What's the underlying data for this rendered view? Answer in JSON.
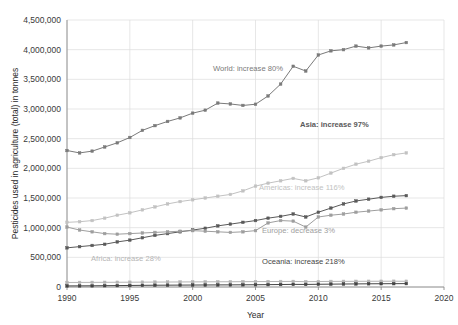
{
  "chart_data": {
    "type": "line",
    "title": "",
    "xlabel": "Year",
    "ylabel": "Pesticides used in agriculture (total) in tonnes",
    "xlim": [
      1990,
      2020
    ],
    "ylim": [
      0,
      4500000
    ],
    "xticks": [
      "1990",
      "1995",
      "2000",
      "2005",
      "2010",
      "2015",
      "2020"
    ],
    "xtick_values": [
      1990,
      1995,
      2000,
      2005,
      2010,
      2015,
      2020
    ],
    "yticks": [
      "0",
      "500,000",
      "1,000,000",
      "1,500,000",
      "2,000,000",
      "2,500,000",
      "3,000,000",
      "3,500,000",
      "4,000,000",
      "4,500,000"
    ],
    "ytick_values": [
      0,
      500000,
      1000000,
      1500000,
      2000000,
      2500000,
      3000000,
      3500000,
      4000000,
      4500000
    ],
    "grid": true,
    "legend_position": "inline-annotations",
    "x": [
      1990,
      1991,
      1992,
      1993,
      1994,
      1995,
      1996,
      1997,
      1998,
      1999,
      2000,
      2001,
      2002,
      2003,
      2004,
      2005,
      2006,
      2007,
      2008,
      2009,
      2010,
      2011,
      2012,
      2013,
      2014,
      2015,
      2016,
      2017
    ],
    "series": [
      {
        "name": "World",
        "annotation": "World: increase 80%",
        "color": "#7a7a7a",
        "bold": false,
        "values": [
          2300000,
          2260000,
          2290000,
          2360000,
          2430000,
          2520000,
          2640000,
          2720000,
          2790000,
          2850000,
          2930000,
          2980000,
          3100000,
          3085000,
          3060000,
          3080000,
          3220000,
          3420000,
          3720000,
          3640000,
          3910000,
          3980000,
          4000000,
          4060000,
          4030000,
          4060000,
          4080000,
          4120000
        ]
      },
      {
        "name": "Asia",
        "annotation": "Asia: increase 97%",
        "color": "#5a5a5a",
        "bold": true,
        "values": [
          660000,
          680000,
          700000,
          720000,
          760000,
          790000,
          830000,
          870000,
          900000,
          930000,
          960000,
          990000,
          1030000,
          1060000,
          1090000,
          1120000,
          1160000,
          1190000,
          1230000,
          1180000,
          1260000,
          1330000,
          1400000,
          1450000,
          1480000,
          1510000,
          1530000,
          1540000
        ]
      },
      {
        "name": "Americas",
        "annotation": "Americas: increase 116%",
        "color": "#c2c2c2",
        "bold": false,
        "values": [
          1090000,
          1100000,
          1120000,
          1160000,
          1210000,
          1250000,
          1300000,
          1350000,
          1400000,
          1440000,
          1470000,
          1500000,
          1530000,
          1560000,
          1620000,
          1700000,
          1750000,
          1790000,
          1830000,
          1790000,
          1840000,
          1920000,
          2000000,
          2070000,
          2120000,
          2180000,
          2230000,
          2260000
        ]
      },
      {
        "name": "Europe",
        "annotation": "Europe: decrease 3%",
        "color": "#9e9e9e",
        "bold": false,
        "values": [
          1010000,
          960000,
          930000,
          900000,
          890000,
          900000,
          910000,
          920000,
          930000,
          940000,
          950000,
          940000,
          930000,
          920000,
          930000,
          950000,
          1080000,
          1120000,
          1110000,
          1010000,
          1180000,
          1210000,
          1230000,
          1260000,
          1280000,
          1300000,
          1320000,
          1330000
        ]
      },
      {
        "name": "Africa",
        "annotation": "Africa: increase 28%",
        "color": "#b5b5b5",
        "bold": false,
        "values": [
          76000,
          77000,
          78000,
          79000,
          80000,
          81000,
          82000,
          83000,
          84000,
          85000,
          86000,
          87000,
          88000,
          89000,
          90000,
          91000,
          92000,
          93000,
          94000,
          90000,
          92000,
          94000,
          95000,
          96000,
          96500,
          97000,
          97500,
          97000
        ]
      },
      {
        "name": "Oceania",
        "annotation": "Oceania: increase 218%",
        "color": "#444444",
        "bold": false,
        "values": [
          18000,
          19000,
          20000,
          22000,
          24000,
          26000,
          28000,
          30000,
          31000,
          32000,
          33000,
          34000,
          35000,
          36000,
          37000,
          38000,
          40000,
          42000,
          44000,
          43000,
          46000,
          48000,
          50000,
          52000,
          54000,
          55000,
          56000,
          57000
        ]
      }
    ],
    "annotation_positions": [
      {
        "series": "World",
        "x": 213,
        "y": 71
      },
      {
        "series": "Asia",
        "x": 300,
        "y": 127
      },
      {
        "series": "Americas",
        "x": 259,
        "y": 190
      },
      {
        "series": "Europe",
        "x": 262,
        "y": 233
      },
      {
        "series": "Oceania",
        "x": 262,
        "y": 264
      },
      {
        "series": "Africa",
        "x": 91,
        "y": 261
      }
    ]
  }
}
